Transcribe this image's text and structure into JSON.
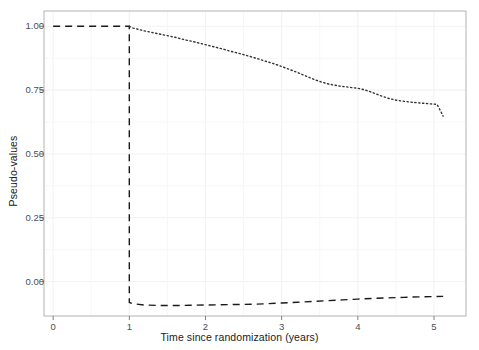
{
  "chart_data": {
    "type": "line",
    "title": "",
    "xlabel": "Time since randomization (years)",
    "ylabel": "Pseudo-values",
    "xlim": [
      -0.12,
      5.42
    ],
    "ylim": [
      -0.135,
      1.06
    ],
    "xticks": [
      0,
      1,
      2,
      3,
      4,
      5
    ],
    "xtick_labels": [
      "0",
      "1",
      "2",
      "3",
      "4",
      "5"
    ],
    "yticks": [
      0.0,
      0.25,
      0.5,
      0.75,
      1.0
    ],
    "ytick_labels": [
      "0.00",
      "0.25",
      "0.50",
      "0.75",
      "1.00"
    ],
    "grid": true,
    "grid_color": "#f2f2f2",
    "panel_border_color": "#b3b3b3",
    "panel_background": "#ffffff",
    "legend": "none",
    "series": [
      {
        "name": "pseudo-values step (dashed)",
        "linetype": "dashed",
        "color": "#1a1a1a",
        "linewidth": 1.4,
        "x": [
          0.0,
          0.2,
          0.4,
          0.6,
          0.8,
          1.0,
          1.0,
          1.05,
          1.2,
          1.4,
          1.6,
          1.8,
          2.0,
          2.2,
          2.4,
          2.6,
          2.8,
          3.0,
          3.2,
          3.4,
          3.6,
          3.8,
          4.0,
          4.2,
          4.4,
          4.6,
          4.8,
          5.0,
          5.12
        ],
        "y": [
          1.0,
          1.0,
          1.0,
          1.0,
          1.0,
          1.0,
          -0.082,
          -0.087,
          -0.092,
          -0.094,
          -0.094,
          -0.093,
          -0.092,
          -0.091,
          -0.09,
          -0.089,
          -0.087,
          -0.084,
          -0.081,
          -0.078,
          -0.075,
          -0.072,
          -0.069,
          -0.066,
          -0.064,
          -0.062,
          -0.06,
          -0.059,
          -0.058
        ]
      },
      {
        "name": "survival curve (dotted)",
        "linetype": "dotted",
        "color": "#333333",
        "linewidth": 1.4,
        "x": [
          1.0,
          1.05,
          1.12,
          1.2,
          1.28,
          1.36,
          1.44,
          1.52,
          1.6,
          1.68,
          1.76,
          1.84,
          1.92,
          2.0,
          2.08,
          2.16,
          2.24,
          2.32,
          2.4,
          2.48,
          2.56,
          2.64,
          2.72,
          2.8,
          2.88,
          2.96,
          3.04,
          3.12,
          3.2,
          3.28,
          3.36,
          3.44,
          3.52,
          3.6,
          3.68,
          3.76,
          3.84,
          3.92,
          4.0,
          4.08,
          4.16,
          4.24,
          4.32,
          4.4,
          4.48,
          4.56,
          4.64,
          4.72,
          4.8,
          4.88,
          4.96,
          5.04,
          5.1,
          5.12
        ],
        "y": [
          1.0,
          0.993,
          0.988,
          0.982,
          0.977,
          0.972,
          0.967,
          0.962,
          0.957,
          0.951,
          0.945,
          0.94,
          0.934,
          0.928,
          0.922,
          0.916,
          0.91,
          0.903,
          0.897,
          0.891,
          0.884,
          0.877,
          0.87,
          0.862,
          0.855,
          0.847,
          0.838,
          0.829,
          0.82,
          0.81,
          0.8,
          0.79,
          0.782,
          0.775,
          0.77,
          0.766,
          0.763,
          0.76,
          0.757,
          0.752,
          0.744,
          0.735,
          0.726,
          0.718,
          0.712,
          0.708,
          0.705,
          0.702,
          0.7,
          0.698,
          0.696,
          0.694,
          0.66,
          0.648
        ]
      }
    ],
    "annotations": [
      {
        "name": "jump-at-t1",
        "x": 1.0,
        "description": "vertical dashed drop from 1.00 to -0.082 at t = 1"
      }
    ]
  }
}
